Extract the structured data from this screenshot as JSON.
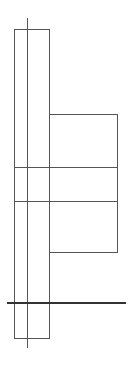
{
  "diagram": {
    "background": "#ffffff",
    "line_color": "#555555",
    "axis_color": "#333333",
    "shapes": {
      "column_rect": {
        "x": 14,
        "y": 29,
        "w": 35,
        "h": 309
      },
      "side_box": {
        "x": 49,
        "y": 114,
        "w": 68,
        "h": 138
      },
      "center_line": {
        "x": 27,
        "y1": 18,
        "y2": 348
      },
      "row_line_1": {
        "y": 167,
        "x1": 14,
        "x2": 117
      },
      "row_line_2": {
        "y": 201,
        "x1": 14,
        "x2": 117
      },
      "base_line": {
        "y": 303,
        "x1": 7,
        "x2": 126
      }
    }
  }
}
